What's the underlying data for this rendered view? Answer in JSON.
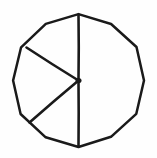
{
  "figure": {
    "type": "hand-drawn geometric diagram",
    "background_color": "#fefefe",
    "ink_color": "#1a1a1a",
    "canvas": {
      "width": 157,
      "height": 158
    }
  },
  "chart_data": {
    "type": "pie",
    "title": "Circle divided into three sectors",
    "subtitle": "",
    "xlabel": "",
    "ylabel": "",
    "grid": false,
    "legend": "none",
    "labels_shown": false,
    "categories": [
      "Sector A",
      "Sector B",
      "Sector C"
    ],
    "values": [
      50,
      16,
      34
    ],
    "units": "percent",
    "start_angle_deg": 90,
    "direction": "clockwise",
    "slice_boundaries_deg": [
      90,
      220,
      147
    ],
    "slices": [
      {
        "name": "Sector A",
        "start_deg": 90,
        "end_deg": -140,
        "sweep_deg": 230,
        "fraction": 0.64,
        "percent": 64
      },
      {
        "name": "Sector B",
        "start_deg": 220,
        "end_deg": 147,
        "sweep_deg": 73,
        "fraction": 0.2,
        "percent": 20
      },
      {
        "name": "Sector C",
        "start_deg": 147,
        "end_deg": 90,
        "sweep_deg": 57,
        "fraction": 0.16,
        "percent": 16
      }
    ]
  },
  "geometry": {
    "center": {
      "x": 78.5,
      "y": 80.5
    },
    "radius": 66,
    "circle_bounds": {
      "left": 12,
      "top": 14,
      "right": 144,
      "bottom": 147
    },
    "radii": [
      {
        "name": "radius-top",
        "angle_deg": 90,
        "endpoint": {
          "x": 78.5,
          "y": 14.5
        }
      },
      {
        "name": "radius-bottom",
        "angle_deg": 270,
        "endpoint": {
          "x": 78.5,
          "y": 146.5
        }
      },
      {
        "name": "radius-upper-left",
        "angle_deg": 147,
        "endpoint": {
          "x": 26.5,
          "y": 47.5
        }
      },
      {
        "name": "radius-lower-left",
        "angle_deg": 220,
        "endpoint": {
          "x": 29.5,
          "y": 122.5
        }
      }
    ],
    "stroke_width": 2.5
  }
}
